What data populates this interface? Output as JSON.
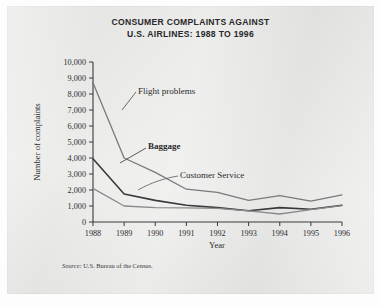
{
  "figure": {
    "title_line1": "CONSUMER COMPLAINTS AGAINST",
    "title_line2": "U.S. AIRLINES: 1988 TO 1996",
    "source_prefix": "Source:",
    "source_text": "U.S. Bureau of the Census.",
    "panel_color": "#e9e9e7",
    "ink_color": "#2e2e30"
  },
  "chart_data": {
    "type": "line",
    "title": "CONSUMER COMPLAINTS AGAINST U.S. AIRLINES: 1988 TO 1996",
    "xlabel": "Year",
    "ylabel": "Number of complaints",
    "categories": [
      "1988",
      "1989",
      "1990",
      "1991",
      "1992",
      "1993",
      "1994",
      "1995",
      "1996"
    ],
    "x": [
      1988,
      1989,
      1990,
      1991,
      1992,
      1993,
      1994,
      1995,
      1996
    ],
    "xlim": [
      1988,
      1996
    ],
    "ylim": [
      0,
      10000
    ],
    "ytick_labels": [
      "0",
      "1,000",
      "2,000",
      "3,000",
      "4,000",
      "5,000",
      "6,000",
      "7,000",
      "8,000",
      "9,000",
      "10,000"
    ],
    "yticks": [
      0,
      1000,
      2000,
      3000,
      4000,
      5000,
      6000,
      7000,
      8000,
      9000,
      10000
    ],
    "grid": false,
    "legend": "inline-annotations",
    "series": [
      {
        "name": "Flight problems",
        "label_bold": false,
        "color": "#7a7a7c",
        "values": [
          8700,
          4000,
          3100,
          2050,
          1850,
          1350,
          1650,
          1300,
          1700
        ]
      },
      {
        "name": "Baggage",
        "label_bold": true,
        "color": "#3a3a3c",
        "values": [
          3950,
          1750,
          1350,
          1050,
          900,
          700,
          900,
          800,
          1050
        ]
      },
      {
        "name": "Customer Service",
        "label_bold": false,
        "color": "#8a8a8c",
        "values": [
          2100,
          1000,
          900,
          880,
          850,
          700,
          500,
          780,
          1020
        ]
      }
    ]
  },
  "annotations": [
    {
      "name": "Flight problems",
      "bold": false
    },
    {
      "name": "Baggage",
      "bold": true
    },
    {
      "name": "Customer Service",
      "bold": false
    }
  ]
}
